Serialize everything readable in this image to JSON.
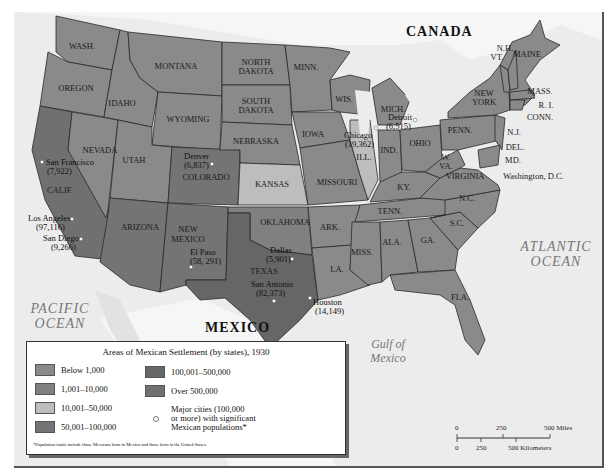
{
  "colors": {
    "below_1000": "#8a8a8a",
    "r1001_10000": "#808080",
    "r10001_50000": "#bdbdbd",
    "r50001_100000": "#747474",
    "r100001_500000": "#666666",
    "over_500000": "#707070",
    "water": "#ededed",
    "land_foreign": "#f7f7f7"
  },
  "countries": {
    "canada": "CANADA",
    "mexico": "MEXICO"
  },
  "water_labels": {
    "pacific_1": "PACIFIC",
    "pacific_2": "OCEAN",
    "atlantic_1": "ATLANTIC",
    "atlantic_2": "OCEAN",
    "gulf_1": "Gulf of",
    "gulf_2": "Mexico"
  },
  "states": {
    "wash": "WASH.",
    "oregon": "OREGON",
    "calif": "CALIF.",
    "idaho": "IDAHO",
    "nevada": "NEVADA",
    "montana": "MONTANA",
    "wyoming": "WYOMING",
    "utah": "UTAH",
    "arizona": "ARIZONA",
    "colorado": "COLORADO",
    "new_mexico_1": "NEW",
    "new_mexico_2": "MEXICO",
    "north_dakota_1": "NORTH",
    "north_dakota_2": "DAKOTA",
    "south_dakota_1": "SOUTH",
    "south_dakota_2": "DAKOTA",
    "nebraska": "NEBRASKA",
    "kansas": "KANSAS",
    "oklahoma": "OKLAHOMA",
    "texas": "TEXAS",
    "minn": "MINN.",
    "iowa": "IOWA",
    "missouri": "MISSOURI",
    "ark": "ARK.",
    "la": "LA.",
    "wis": "WIS.",
    "ill": "ILL.",
    "mich": "MICH.",
    "ind": "IND.",
    "ohio": "OHIO",
    "ky": "KY.",
    "tenn": "TENN.",
    "miss": "MISS.",
    "ala": "ALA.",
    "ga": "GA.",
    "fla": "FLA.",
    "sc": "S.C.",
    "nc": "N.C.",
    "virginia": "VIRGINIA",
    "wva_1": "W.",
    "wva_2": "VA.",
    "penn": "PENN.",
    "new_york_1": "NEW",
    "new_york_2": "YORK",
    "vt": "VT.",
    "nh": "N.H.",
    "maine": "MAINE",
    "mass": "MASS.",
    "ri": "R. I.",
    "conn": "CONN.",
    "nj": "N.J.",
    "del": "DEL.",
    "md": "MD.",
    "dc": "Washington, D.C."
  },
  "cities": [
    {
      "name": "San Francisco",
      "pop": "(7,922)"
    },
    {
      "name": "Los Angeles",
      "pop": "(97,116)"
    },
    {
      "name": "San Diego",
      "pop": "(9,266)"
    },
    {
      "name": "Denver",
      "pop": "(6,837)"
    },
    {
      "name": "El Paso",
      "pop": "(58, 291)"
    },
    {
      "name": "Dallas",
      "pop": "(5,901)"
    },
    {
      "name": "San Antonio",
      "pop": "(82,373)"
    },
    {
      "name": "Houston",
      "pop": "(14,149)"
    },
    {
      "name": "Chicago",
      "pop": "(19,362)"
    },
    {
      "name": "Detroit",
      "pop": "(6,515)"
    }
  ],
  "legend": {
    "title": "Areas of Mexican Settlement (by states), 1930",
    "items": [
      {
        "label": "Below 1,000"
      },
      {
        "label": "1,001–10,000"
      },
      {
        "label": "10,001–50,000"
      },
      {
        "label": "50,001–100,000"
      },
      {
        "label": "100,001–500,000"
      },
      {
        "label": "Over 500,000"
      }
    ],
    "cities_line1": "Major cities (100,000",
    "cities_line2": "or more) with significant",
    "cities_line3": "Mexican populations*",
    "footnote": "*Population totals include those Mexicans born in Mexico and those born in the United States."
  },
  "scale": {
    "miles": [
      "0",
      "250",
      "500 Miles"
    ],
    "km": [
      "0",
      "250",
      "500 Kilometers"
    ]
  }
}
